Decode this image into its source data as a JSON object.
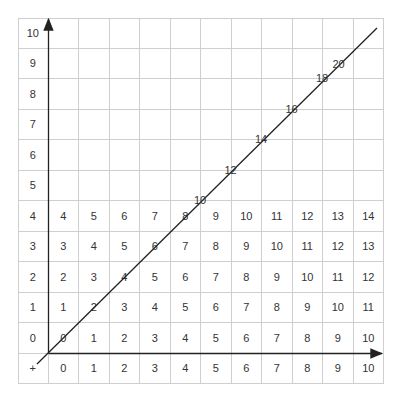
{
  "axes": {
    "origin_label": "+",
    "x_labels": [
      "0",
      "1",
      "2",
      "3",
      "4",
      "5",
      "6",
      "7",
      "8",
      "9",
      "10"
    ],
    "y_labels": [
      "0",
      "1",
      "2",
      "3",
      "4",
      "5",
      "6",
      "7",
      "8",
      "9",
      "10"
    ]
  },
  "table_rows": [
    {
      "y": "0",
      "values": [
        "0",
        "1",
        "2",
        "3",
        "4",
        "5",
        "6",
        "7",
        "8",
        "9",
        "10"
      ]
    },
    {
      "y": "1",
      "values": [
        "1",
        "2",
        "3",
        "4",
        "5",
        "6",
        "7",
        "8",
        "9",
        "10",
        "11"
      ]
    },
    {
      "y": "2",
      "values": [
        "2",
        "3",
        "4",
        "5",
        "6",
        "7",
        "8",
        "9",
        "10",
        "11",
        "12"
      ]
    },
    {
      "y": "3",
      "values": [
        "3",
        "4",
        "5",
        "6",
        "7",
        "8",
        "9",
        "10",
        "11",
        "12",
        "13"
      ]
    },
    {
      "y": "4",
      "values": [
        "4",
        "5",
        "6",
        "7",
        "8",
        "9",
        "10",
        "11",
        "12",
        "13",
        "14"
      ]
    }
  ],
  "diagonal_labels": [
    "10",
    "12",
    "14",
    "16",
    "18",
    "20"
  ],
  "colors": {
    "grid": "#cfcfcf",
    "axis": "#222222",
    "text": "#333333"
  }
}
